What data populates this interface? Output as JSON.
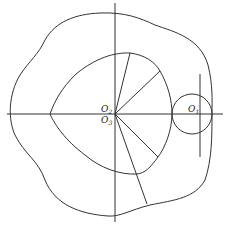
{
  "diagram": {
    "type": "cam-mechanism",
    "labels": {
      "o2": {
        "base": "O",
        "sub": "2"
      },
      "o3": {
        "base": "O",
        "sub": "3"
      },
      "o1": {
        "base": "O",
        "sub": "1"
      }
    },
    "colors": {
      "stroke": "#333333",
      "background": "#ffffff"
    }
  }
}
